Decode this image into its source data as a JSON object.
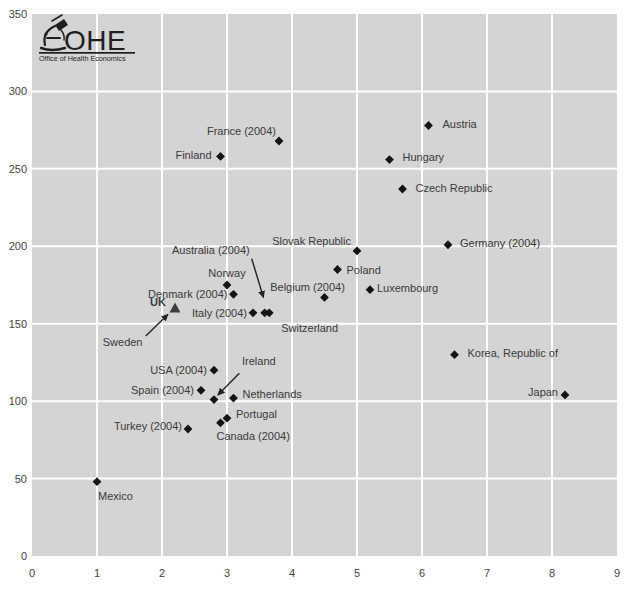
{
  "colors": {
    "page_bg": "#ffffff",
    "plot_bg": "#d4d4d4",
    "grid": "#ffffff",
    "marker": "#141414",
    "uk_marker": "#3f3f3f",
    "label": "#3a3a3a",
    "tick_label": "#3f3f3f",
    "arrow": "#222222",
    "logo_ink": "#1f1f1f"
  },
  "logo": {
    "name": "OHE",
    "subtitle": "Office of Health Economics",
    "icon": "microscope-icon"
  },
  "chart_data": {
    "type": "scatter",
    "title": "",
    "xlabel": "",
    "ylabel": "",
    "xlim": [
      0,
      9
    ],
    "ylim": [
      0,
      350
    ],
    "xticks": [
      0,
      1,
      2,
      3,
      4,
      5,
      6,
      7,
      8,
      9
    ],
    "yticks": [
      0,
      50,
      100,
      150,
      200,
      250,
      300,
      350
    ],
    "grid": true,
    "legend": "none",
    "marker_style": "filled-diamond",
    "points": [
      {
        "label": "Austria",
        "x": 6.1,
        "y": 278,
        "marker": "diamond",
        "anchor": "start",
        "dx": 14,
        "dy": -1
      },
      {
        "label": "France (2004)",
        "x": 3.8,
        "y": 268,
        "marker": "diamond",
        "anchor": "end",
        "dx": -3,
        "dy": -10
      },
      {
        "label": "Finland",
        "x": 2.9,
        "y": 258,
        "marker": "diamond",
        "anchor": "end",
        "dx": -9,
        "dy": -1
      },
      {
        "label": "Hungary",
        "x": 5.5,
        "y": 256,
        "marker": "diamond",
        "anchor": "start",
        "dx": 13,
        "dy": -3
      },
      {
        "label": "Czech Republic",
        "x": 5.7,
        "y": 237,
        "marker": "diamond",
        "anchor": "start",
        "dx": 13,
        "dy": -1
      },
      {
        "label": "Germany (2004)",
        "x": 6.4,
        "y": 201,
        "marker": "diamond",
        "anchor": "start",
        "dx": 12,
        "dy": -2
      },
      {
        "label": "Slovak Republic",
        "x": 5.0,
        "y": 197,
        "marker": "diamond",
        "anchor": "end",
        "dx": -6,
        "dy": -10
      },
      {
        "label": "Poland",
        "x": 4.7,
        "y": 185,
        "marker": "diamond",
        "anchor": "start",
        "dx": 9,
        "dy": 0
      },
      {
        "label": "Norway",
        "x": 3.0,
        "y": 175,
        "marker": "diamond",
        "anchor": "middle",
        "dx": 0,
        "dy": -12
      },
      {
        "label": "Luxembourg",
        "x": 5.2,
        "y": 172,
        "marker": "diamond",
        "anchor": "start",
        "dx": 7,
        "dy": -2
      },
      {
        "label": "Denmark (2004)",
        "x": 3.1,
        "y": 169,
        "marker": "diamond",
        "anchor": "end",
        "dx": -6,
        "dy": 0
      },
      {
        "label": "Belgium (2004)",
        "x": 4.5,
        "y": 167,
        "marker": "diamond",
        "anchor": "middle",
        "dx": -17,
        "dy": -10
      },
      {
        "label": "UK",
        "x": 2.2,
        "y": 160,
        "marker": "triangle",
        "bold": true,
        "anchor": "end",
        "dx": -9,
        "dy": -6
      },
      {
        "label": "Italy (2004)",
        "x": 3.4,
        "y": 157,
        "marker": "diamond",
        "anchor": "end",
        "dx": -6,
        "dy": 0
      },
      {
        "label": "Australia (2004)",
        "x": 3.58,
        "y": 157,
        "marker": "diamond",
        "anchor": "end",
        "dx": -15,
        "dy": -63,
        "arrow": {
          "from": [
            3.38,
            192
          ],
          "to": [
            3.56,
            167
          ]
        }
      },
      {
        "label": "Switzerland",
        "x": 3.65,
        "y": 157,
        "marker": "diamond",
        "anchor": "start",
        "dx": 12,
        "dy": 15
      },
      {
        "label": "Sweden",
        "x": 1.7,
        "y": 138,
        "marker": "none",
        "anchor": "end",
        "dx": 0,
        "dy": 0,
        "arrow": {
          "from": [
            1.75,
            142
          ],
          "to": [
            2.09,
            156
          ]
        }
      },
      {
        "label": "Korea, Republic of",
        "x": 6.5,
        "y": 130,
        "marker": "diamond",
        "anchor": "start",
        "dx": 13,
        "dy": -2
      },
      {
        "label": "USA (2004)",
        "x": 2.8,
        "y": 120,
        "marker": "diamond",
        "anchor": "end",
        "dx": -7,
        "dy": 0
      },
      {
        "label": "Spain (2004)",
        "x": 2.6,
        "y": 107,
        "marker": "diamond",
        "anchor": "end",
        "dx": -7,
        "dy": 0
      },
      {
        "label": "Japan",
        "x": 8.2,
        "y": 104,
        "marker": "diamond",
        "anchor": "end",
        "dx": -7,
        "dy": -3
      },
      {
        "label": "Netherlands",
        "x": 3.1,
        "y": 102,
        "marker": "diamond",
        "anchor": "start",
        "dx": 9,
        "dy": -4
      },
      {
        "label": "Ireland",
        "x": 2.8,
        "y": 101,
        "marker": "diamond",
        "anchor": "start",
        "dx": 28,
        "dy": -39,
        "arrow": {
          "from": [
            3.19,
            118
          ],
          "to": [
            2.86,
            104
          ]
        }
      },
      {
        "label": "Portugal",
        "x": 3.0,
        "y": 89,
        "marker": "diamond",
        "anchor": "start",
        "dx": 9,
        "dy": -4
      },
      {
        "label": "Canada (2004)",
        "x": 2.9,
        "y": 86,
        "marker": "diamond",
        "anchor": "start",
        "dx": -4,
        "dy": 13
      },
      {
        "label": "Turkey (2004)",
        "x": 2.4,
        "y": 82,
        "marker": "diamond",
        "anchor": "end",
        "dx": -6,
        "dy": -3
      },
      {
        "label": "Mexico",
        "x": 1.0,
        "y": 48,
        "marker": "diamond",
        "anchor": "start",
        "dx": 1,
        "dy": 14
      }
    ]
  }
}
